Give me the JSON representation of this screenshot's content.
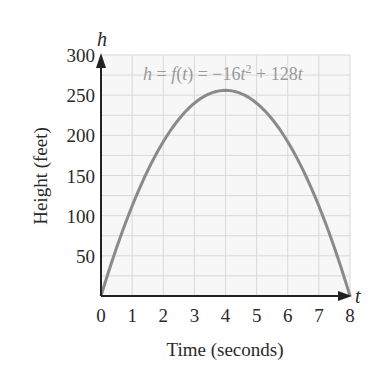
{
  "chart_data": {
    "type": "line",
    "title": "",
    "annotation": "h = f(t) = −16t² + 128t",
    "xlabel": "Time (seconds)",
    "ylabel": "Height (feet)",
    "x_var": "t",
    "y_var": "h",
    "xlim": [
      0,
      8
    ],
    "ylim": [
      0,
      300
    ],
    "x_ticks": [
      "0",
      "1",
      "2",
      "3",
      "4",
      "5",
      "6",
      "7",
      "8"
    ],
    "y_ticks": [
      "50",
      "100",
      "150",
      "200",
      "250",
      "300"
    ],
    "grid": true,
    "x": [
      0,
      1,
      2,
      3,
      4,
      5,
      6,
      7,
      8
    ],
    "series": [
      {
        "name": "h = -16t^2 + 128t",
        "values": [
          0,
          112,
          192,
          240,
          256,
          240,
          192,
          112,
          0
        ]
      }
    ]
  },
  "labels": {
    "eq_h": "h",
    "eq_mid1": " = ",
    "eq_f": "f",
    "eq_paren_open": "(",
    "eq_t1": "t",
    "eq_paren_close": ")",
    "eq_mid2": " = −16",
    "eq_t2": "t",
    "eq_sup": "2",
    "eq_mid3": " + 128",
    "eq_t3": "t"
  },
  "colors": {
    "curve": "#8a8a8a",
    "grid": "#d9d9d9",
    "axis": "#222222",
    "plot_bg": "#f7f7f7"
  }
}
